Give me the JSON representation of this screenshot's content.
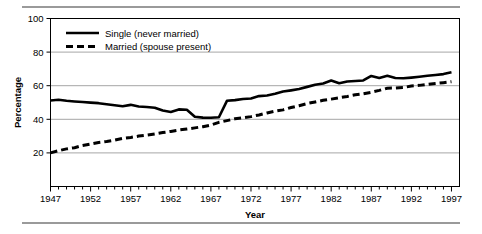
{
  "figure": {
    "has_top_rule": true,
    "has_bottom_rule": true,
    "rule_color": "#9a9a9a",
    "background": "#ffffff"
  },
  "chart_data": {
    "type": "line",
    "title": "",
    "xlabel": "Year",
    "ylabel": "Percentage",
    "xlim": [
      1947,
      1998
    ],
    "ylim": [
      0,
      100
    ],
    "ytick_values": [
      20,
      40,
      60,
      80,
      100
    ],
    "ytick_labels": [
      "20",
      "40",
      "60",
      "80",
      "100"
    ],
    "xtick_values": [
      1947,
      1952,
      1957,
      1962,
      1967,
      1972,
      1977,
      1982,
      1987,
      1992,
      1997
    ],
    "xtick_labels": [
      "1947",
      "1952",
      "1957",
      "1962",
      "1967",
      "1972",
      "1977",
      "1982",
      "1987",
      "1992",
      "1997"
    ],
    "minor_xtick_interval": 1,
    "grid": "horizontal",
    "grid_color": "#a6a6a6",
    "legend_position": "upper left inside",
    "line_color": "#000000",
    "x": [
      1947,
      1948,
      1949,
      1950,
      1951,
      1952,
      1953,
      1954,
      1955,
      1956,
      1957,
      1958,
      1959,
      1960,
      1961,
      1962,
      1963,
      1964,
      1965,
      1966,
      1967,
      1968,
      1969,
      1970,
      1971,
      1972,
      1973,
      1974,
      1975,
      1976,
      1977,
      1978,
      1979,
      1980,
      1981,
      1982,
      1983,
      1984,
      1985,
      1986,
      1987,
      1988,
      1989,
      1990,
      1991,
      1992,
      1993,
      1994,
      1995,
      1996,
      1997
    ],
    "series": [
      {
        "name": "Single (never married)",
        "style": "solid",
        "values": [
          51.2,
          51.6,
          51.0,
          50.6,
          50.3,
          49.9,
          49.6,
          49.0,
          48.4,
          47.8,
          48.6,
          47.6,
          47.3,
          46.9,
          45.2,
          44.4,
          45.9,
          45.7,
          41.5,
          41.0,
          40.9,
          41.2,
          51.0,
          51.4,
          52.1,
          52.4,
          53.8,
          54.2,
          55.2,
          56.5,
          57.2,
          58.0,
          59.3,
          60.6,
          61.3,
          63.1,
          61.5,
          62.5,
          62.8,
          63.1,
          65.8,
          64.6,
          65.9,
          64.6,
          64.4,
          64.8,
          65.3,
          65.9,
          66.4,
          66.9,
          68.0
        ]
      },
      {
        "name": "Married (spouse present)",
        "style": "dashed",
        "values": [
          20.0,
          21.3,
          22.4,
          23.1,
          24.4,
          25.3,
          26.2,
          26.8,
          27.6,
          28.6,
          29.2,
          30.0,
          30.6,
          31.3,
          32.1,
          32.8,
          33.6,
          34.2,
          34.9,
          35.6,
          36.6,
          38.2,
          39.2,
          40.3,
          40.9,
          41.6,
          42.6,
          43.8,
          44.8,
          45.6,
          47.0,
          48.1,
          49.4,
          50.3,
          51.3,
          52.0,
          52.8,
          53.6,
          54.6,
          55.2,
          56.1,
          57.2,
          58.5,
          58.6,
          58.9,
          59.8,
          60.2,
          60.8,
          61.3,
          61.8,
          62.4
        ]
      }
    ]
  }
}
